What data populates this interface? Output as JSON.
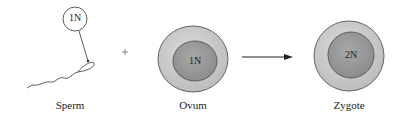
{
  "diagram": {
    "sperm": {
      "label": "Sperm",
      "ploidy": "1N"
    },
    "operator": "+",
    "ovum": {
      "label": "Ovum",
      "ploidy": "1N"
    },
    "arrow": "right-arrow",
    "zygote": {
      "label": "Zygote",
      "ploidy": "2N"
    }
  },
  "colors": {
    "cytoplasm": "#c9c9c9",
    "nucleus": "#9a9a9a",
    "outline": "#555555",
    "text": "#222222"
  }
}
